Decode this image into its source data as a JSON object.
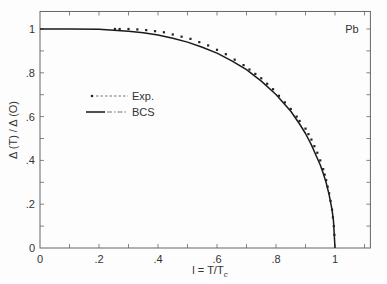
{
  "chart_data": {
    "type": "line",
    "title": "",
    "annotation": "Pb",
    "xlabel": "l = T/T",
    "xlabel_subscript": "c",
    "ylabel": "Δ (T) / Δ (O)",
    "xlim": [
      0,
      1.12
    ],
    "ylim": [
      0,
      1.08
    ],
    "grid": false,
    "legend_position": "upper-left-inner",
    "x_ticks": [
      0,
      0.2,
      0.4,
      0.6,
      0.8,
      1.0
    ],
    "x_tick_labels": [
      "0",
      ".2",
      ".4",
      ".6",
      ".8",
      "1"
    ],
    "y_ticks": [
      0,
      0.2,
      0.4,
      0.6,
      0.8,
      1.0
    ],
    "y_tick_labels": [
      "0",
      ".2",
      ".4",
      ".6",
      ".8",
      "1"
    ],
    "series": [
      {
        "name": "Exp.",
        "style": "dots",
        "x": [
          0.254,
          0.27,
          0.3,
          0.33,
          0.36,
          0.39,
          0.42,
          0.45,
          0.48,
          0.51,
          0.54,
          0.57,
          0.6,
          0.63,
          0.66,
          0.69,
          0.71,
          0.73,
          0.75,
          0.77,
          0.79,
          0.81,
          0.83,
          0.85,
          0.87,
          0.88,
          0.9,
          0.91,
          0.92,
          0.93,
          0.94,
          0.95,
          0.96,
          0.965,
          0.97,
          0.975,
          0.98,
          0.985,
          0.99,
          0.993,
          0.996,
          0.998
        ],
        "y": [
          1.0,
          1.0,
          1.0,
          0.998,
          0.995,
          0.99,
          0.985,
          0.975,
          0.965,
          0.955,
          0.94,
          0.925,
          0.905,
          0.885,
          0.86,
          0.835,
          0.815,
          0.795,
          0.775,
          0.75,
          0.725,
          0.695,
          0.665,
          0.635,
          0.6,
          0.58,
          0.545,
          0.52,
          0.495,
          0.465,
          0.435,
          0.4,
          0.36,
          0.335,
          0.31,
          0.28,
          0.25,
          0.215,
          0.175,
          0.14,
          0.1,
          0.06
        ]
      },
      {
        "name": "BCS",
        "style": "solid",
        "x": [
          0,
          0.1,
          0.2,
          0.3,
          0.35,
          0.4,
          0.45,
          0.5,
          0.55,
          0.6,
          0.65,
          0.7,
          0.75,
          0.8,
          0.85,
          0.88,
          0.9,
          0.92,
          0.94,
          0.95,
          0.96,
          0.97,
          0.98,
          0.99,
          0.995,
          1.0
        ],
        "y": [
          1.0,
          1.0,
          0.999,
          0.99,
          0.983,
          0.972,
          0.958,
          0.94,
          0.917,
          0.89,
          0.855,
          0.814,
          0.762,
          0.701,
          0.624,
          0.566,
          0.523,
          0.471,
          0.41,
          0.379,
          0.341,
          0.299,
          0.244,
          0.173,
          0.123,
          0.0
        ]
      }
    ]
  },
  "legend": {
    "items": [
      {
        "label": "Exp."
      },
      {
        "label": "BCS"
      }
    ]
  }
}
